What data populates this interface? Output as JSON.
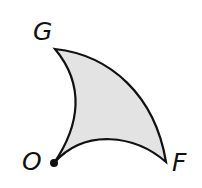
{
  "diagram": {
    "type": "curved-triangle-region",
    "fill_color": "#e3e3e3",
    "stroke_color": "#111111",
    "points": {
      "G": {
        "label": "G",
        "x": 55,
        "y": 49
      },
      "O": {
        "label": "O",
        "x": 54,
        "y": 163
      },
      "F": {
        "label": "F",
        "x": 166,
        "y": 162
      }
    },
    "edges": [
      {
        "from": "G",
        "to": "F",
        "shape": "convex-outward arc"
      },
      {
        "from": "G",
        "to": "O",
        "shape": "concave inward arc"
      },
      {
        "from": "O",
        "to": "F",
        "shape": "concave inward arc"
      }
    ],
    "marked_point": "O"
  }
}
